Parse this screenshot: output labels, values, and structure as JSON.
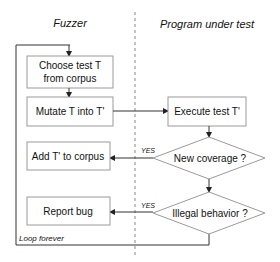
{
  "diagram": {
    "lanes": {
      "left_title": "Fuzzer",
      "right_title": "Program under test"
    },
    "nodes": {
      "choose": {
        "line1": "Choose test T",
        "line2": "from corpus"
      },
      "mutate": {
        "label": "Mutate T into T'"
      },
      "execute": {
        "label": "Execute test T'"
      },
      "new_coverage": {
        "label": "New coverage ?"
      },
      "illegal_behavior": {
        "label": "Illegal behavior ?"
      },
      "add_corpus": {
        "label": "Add T' to corpus"
      },
      "report_bug": {
        "label": "Report bug"
      }
    },
    "edges": {
      "yes1": "YES",
      "yes2": "YES"
    },
    "loop_label": "Loop forever",
    "colors": {
      "box_border": "#9a9a9a",
      "line": "#333333",
      "divider": "#8a8a8a",
      "text": "#111111"
    }
  }
}
